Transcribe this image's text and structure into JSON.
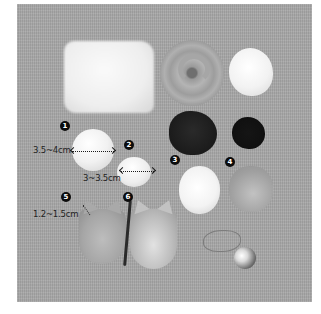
{
  "image": {
    "description": "Grayscale photo of wool felting materials on a gray fabric background, with numbered callouts and size annotations",
    "background_color": "#a9a9a9"
  },
  "callouts": [
    {
      "number": "1",
      "glyph": "❶"
    },
    {
      "number": "2",
      "glyph": "❷"
    },
    {
      "number": "3",
      "glyph": "❸"
    },
    {
      "number": "4",
      "glyph": "❹"
    },
    {
      "number": "5",
      "glyph": "❺"
    },
    {
      "number": "6",
      "glyph": "❻"
    }
  ],
  "measurements": [
    {
      "item": "1",
      "label": "3.5~4cm"
    },
    {
      "item": "2",
      "label": "3~3.5cm"
    },
    {
      "item": "5",
      "label": "1.2~1.5cm"
    }
  ],
  "objects": [
    "white-wool-batt",
    "gray-roving-coil",
    "white-wool-puff",
    "dark-wool-tuft-large",
    "dark-wool-tuft-small",
    "white-felt-ball-1",
    "white-felt-ball-2",
    "white-felt-oval-3",
    "gray-felt-oval-4",
    "felt-cat-body-5",
    "felt-cat-body-6",
    "wire-outline",
    "glass-bead"
  ]
}
